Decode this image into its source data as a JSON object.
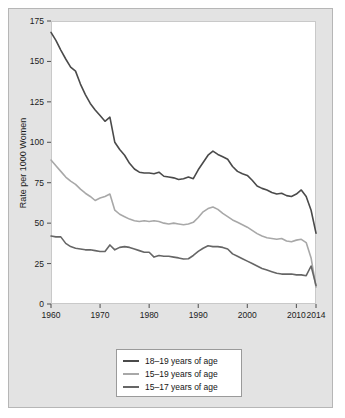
{
  "figure": {
    "background": "#ffffff",
    "panel_background": "#e3e3e3",
    "plot_background": "#ffffff"
  },
  "legend": {
    "position": "below-axes",
    "entries": [
      {
        "label": "18–19 years of age",
        "color": "#4a4a4a",
        "swatch_name": "legend-swatch-18-19"
      },
      {
        "label": "15–19 years of age",
        "color": "#a8a8a8",
        "swatch_name": "legend-swatch-15-19"
      },
      {
        "label": "15–17 years of age",
        "color": "#666666",
        "swatch_name": "legend-swatch-15-17"
      }
    ]
  },
  "chart_data": {
    "type": "line",
    "title": "",
    "subtitle": "",
    "xlabel": "",
    "ylabel": "Rate per 1000 Women",
    "xlim": [
      1960,
      2014
    ],
    "ylim": [
      0,
      175
    ],
    "grid": false,
    "legend_position": "below",
    "xticks": [
      1960,
      1970,
      1980,
      1990,
      2000,
      2010,
      2014
    ],
    "xtick_labels": [
      "1960",
      "1970",
      "1980",
      "1990",
      "2000",
      "2010",
      "2014"
    ],
    "yticks": [
      0,
      25,
      50,
      75,
      100,
      125,
      150,
      175
    ],
    "ytick_labels": [
      "0",
      "25",
      "50",
      "75",
      "100",
      "125",
      "150",
      "175"
    ],
    "x": [
      1960,
      1961,
      1962,
      1963,
      1964,
      1965,
      1966,
      1967,
      1968,
      1969,
      1970,
      1971,
      1972,
      1973,
      1974,
      1975,
      1976,
      1977,
      1978,
      1979,
      1980,
      1981,
      1982,
      1983,
      1984,
      1985,
      1986,
      1987,
      1988,
      1989,
      1990,
      1991,
      1992,
      1993,
      1994,
      1995,
      1996,
      1997,
      1998,
      1999,
      2000,
      2001,
      2002,
      2003,
      2004,
      2005,
      2006,
      2007,
      2008,
      2009,
      2010,
      2011,
      2012,
      2013,
      2014
    ],
    "series": [
      {
        "name": "18–19 years of age",
        "color": "#4a4a4a",
        "values": [
          168.0,
          163.0,
          157.0,
          151.5,
          146.5,
          144.0,
          136.0,
          129.5,
          124.0,
          120.0,
          116.5,
          113.0,
          115.5,
          100.0,
          95.5,
          92.0,
          87.0,
          83.5,
          81.5,
          81.0,
          81.0,
          80.5,
          81.5,
          79.0,
          78.5,
          78.0,
          77.0,
          77.5,
          78.5,
          77.5,
          83.0,
          87.5,
          92.0,
          94.5,
          92.5,
          91.0,
          89.5,
          85.0,
          82.0,
          80.5,
          79.5,
          76.5,
          73.0,
          71.5,
          70.5,
          69.0,
          68.0,
          68.5,
          67.0,
          66.5,
          68.0,
          70.5,
          66.5,
          58.0,
          43.8
        ]
      },
      {
        "name": "15–19 years of age",
        "color": "#a8a8a8",
        "values": [
          89.0,
          85.5,
          82.0,
          78.5,
          76.0,
          74.0,
          71.0,
          68.5,
          66.5,
          64.0,
          65.5,
          66.5,
          68.0,
          58.0,
          55.5,
          54.0,
          52.5,
          51.5,
          51.0,
          51.5,
          51.0,
          51.5,
          51.0,
          50.0,
          49.5,
          50.0,
          49.5,
          49.0,
          49.5,
          50.5,
          53.5,
          57.0,
          59.0,
          60.0,
          58.5,
          56.0,
          54.0,
          52.0,
          50.5,
          49.0,
          47.5,
          45.5,
          43.5,
          42.0,
          41.0,
          40.5,
          40.0,
          40.5,
          39.0,
          38.5,
          39.5,
          40.0,
          38.0,
          28.5,
          10.5
        ]
      },
      {
        "name": "15–17 years of age",
        "color": "#666666",
        "values": [
          42.0,
          41.5,
          41.5,
          37.5,
          35.5,
          34.5,
          34.0,
          33.5,
          33.5,
          33.0,
          32.5,
          32.5,
          36.5,
          33.5,
          35.0,
          35.5,
          35.0,
          34.0,
          33.0,
          32.0,
          32.0,
          29.0,
          30.0,
          29.5,
          29.5,
          29.0,
          28.5,
          27.8,
          28.0,
          30.0,
          32.5,
          34.5,
          36.0,
          35.5,
          35.5,
          35.0,
          34.0,
          31.0,
          29.5,
          28.0,
          26.5,
          25.0,
          23.5,
          22.0,
          21.0,
          20.0,
          19.0,
          18.5,
          18.5,
          18.5,
          18.0,
          18.0,
          17.5,
          23.5,
          11.5
        ]
      }
    ]
  }
}
